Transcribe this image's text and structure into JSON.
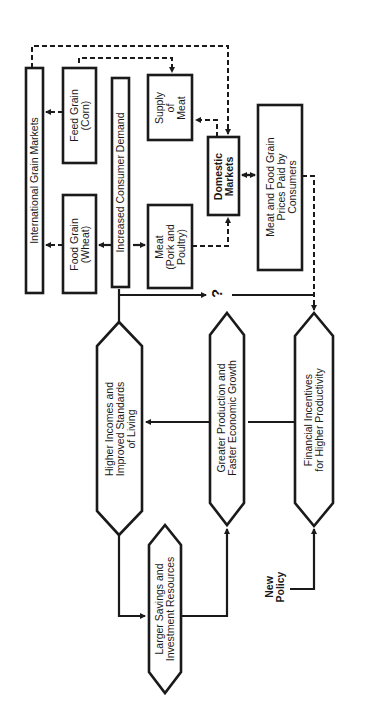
{
  "diagram": {
    "orientation": "rotated -90 degrees (reads bottom-to-top)",
    "stroke_color": "#1a1a1a",
    "background": "#ffffff",
    "nodes": {
      "intl_grain_markets": {
        "label": "International Grain Markets",
        "shape": "rectangle"
      },
      "feed_grain": {
        "label": "Feed Grain\n(Corn)",
        "shape": "rectangle"
      },
      "food_grain": {
        "label": "Food Grain\n(Wheat)",
        "shape": "rectangle"
      },
      "consumer_demand": {
        "label": "Increased Consumer Demand",
        "shape": "rectangle"
      },
      "supply_of_meat": {
        "label": "Supply\nof\nMeat",
        "shape": "rectangle"
      },
      "meat": {
        "label": "Meat\n(Pork and\nPoultry)",
        "shape": "rectangle"
      },
      "domestic_markets": {
        "label": "Domestic\nMarkets",
        "shape": "rectangle"
      },
      "consumer_prices": {
        "label": "Meat and Food Grain\nPrices Paid by\nConsumers",
        "shape": "rectangle"
      },
      "higher_incomes": {
        "label": "Higher Incomes and\nImproved Standards\nof Living",
        "shape": "hexagon"
      },
      "greater_production": {
        "label": "Greater Production and\nFaster Economic Growth",
        "shape": "hexagon"
      },
      "financial_incentives": {
        "label": "Financial Incentives\nfor Higher Productivity",
        "shape": "hexagon"
      },
      "larger_savings": {
        "label": "Larger Savings and\nInvestment Resources",
        "shape": "hexagon"
      },
      "new_policy": {
        "label": "New\nPolicy",
        "shape": "text"
      }
    },
    "question_mark": "?",
    "edges": [
      {
        "from": "new_policy",
        "to": "financial_incentives",
        "style": "solid"
      },
      {
        "from": "financial_incentives",
        "to": "greater_production",
        "style": "solid"
      },
      {
        "from": "greater_production",
        "to": "higher_incomes",
        "style": "solid"
      },
      {
        "from": "higher_incomes",
        "to": "larger_savings",
        "style": "solid"
      },
      {
        "from": "larger_savings",
        "to": "greater_production",
        "style": "solid"
      },
      {
        "from": "higher_incomes",
        "to": "consumer_demand",
        "style": "solid"
      },
      {
        "from": "higher_incomes",
        "to": "financial_incentives",
        "style": "solid",
        "label": "?"
      },
      {
        "from": "consumer_demand",
        "to": "food_grain",
        "style": "solid"
      },
      {
        "from": "consumer_demand",
        "to": "meat",
        "style": "solid"
      },
      {
        "from": "food_grain",
        "to": "intl_grain_markets",
        "style": "dashed"
      },
      {
        "from": "feed_grain",
        "to": "intl_grain_markets",
        "style": "dashed"
      },
      {
        "from": "feed_grain",
        "to": "supply_of_meat",
        "style": "dashed"
      },
      {
        "from": "intl_grain_markets",
        "to": "domestic_markets",
        "style": "dashed"
      },
      {
        "from": "domestic_markets",
        "to": "supply_of_meat",
        "style": "dashed"
      },
      {
        "from": "meat",
        "to": "domestic_markets",
        "style": "dashed"
      },
      {
        "from": "domestic_markets",
        "to": "consumer_prices",
        "style": "solid",
        "bidirectional": true
      },
      {
        "from": "consumer_prices",
        "to": "financial_incentives",
        "style": "dashed"
      }
    ]
  }
}
